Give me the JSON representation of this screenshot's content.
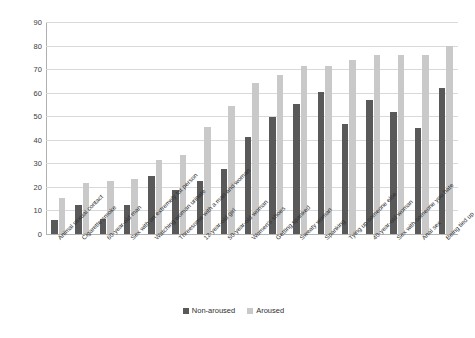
{
  "chart_data": {
    "type": "bar",
    "title": "",
    "subtitle": "",
    "xlabel": "",
    "ylabel": "",
    "ylim": [
      0,
      90
    ],
    "ytick_step": 10,
    "yticks": [
      "0",
      "10",
      "20",
      "30",
      "40",
      "50",
      "60",
      "70",
      "80",
      "90"
    ],
    "grid": true,
    "legend_position": "bottom-center",
    "categories": [
      "Animal sexual contact",
      "Cigarette smoke",
      "60-year-old man",
      "Sex with an extremely fat person",
      "Watching woman urinate",
      "Threesome with a man and woman",
      "12-year-old girl",
      "50-year-old woman",
      "Women's shoes",
      "Getting spanked",
      "Sweaty woman",
      "Spanking",
      "Tying up someone else",
      "40-year-old woman",
      "Sex with someone you hate",
      "Anal sex",
      "Being tied up"
    ],
    "series": [
      {
        "name": "Non-aroused",
        "color": "#595959",
        "values": [
          6,
          12.5,
          6.5,
          12.5,
          24.5,
          18.5,
          22.5,
          27.5,
          41,
          49.5,
          55,
          60.5,
          46.5,
          57,
          52,
          45,
          62
        ]
      },
      {
        "name": "Aroused",
        "color": "#c9c9c9",
        "values": [
          15.5,
          21.5,
          22.5,
          23.5,
          31.5,
          33.5,
          45.5,
          54.5,
          64,
          67.5,
          71.5,
          71.5,
          74,
          76,
          76,
          76,
          80
        ]
      }
    ]
  },
  "legend": {
    "items": [
      {
        "label": "Non-aroused",
        "color": "#595959"
      },
      {
        "label": "Aroused",
        "color": "#c9c9c9"
      }
    ]
  }
}
